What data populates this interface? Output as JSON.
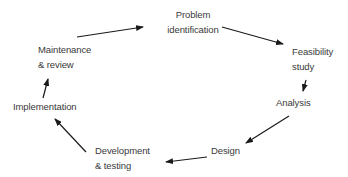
{
  "diagram": {
    "type": "cycle",
    "colors": {
      "text": "#3a3a3a",
      "arrow": "#1a1a1a",
      "background": "#ffffff"
    },
    "nodes": [
      {
        "id": "problem",
        "lines": [
          "Problem",
          "identification"
        ]
      },
      {
        "id": "feasibility",
        "lines": [
          "Feasibility",
          "study"
        ]
      },
      {
        "id": "analysis",
        "lines": [
          "Analysis"
        ]
      },
      {
        "id": "design",
        "lines": [
          "Design"
        ]
      },
      {
        "id": "development",
        "lines": [
          "Development",
          "& testing"
        ]
      },
      {
        "id": "implementation",
        "lines": [
          "Implementation"
        ]
      },
      {
        "id": "maintenance",
        "lines": [
          "Maintenance",
          "& review"
        ]
      }
    ],
    "edges": [
      {
        "from": "maintenance",
        "to": "problem"
      },
      {
        "from": "problem",
        "to": "feasibility"
      },
      {
        "from": "feasibility",
        "to": "analysis"
      },
      {
        "from": "analysis",
        "to": "design"
      },
      {
        "from": "design",
        "to": "development"
      },
      {
        "from": "development",
        "to": "implementation"
      },
      {
        "from": "implementation",
        "to": "maintenance"
      }
    ]
  }
}
